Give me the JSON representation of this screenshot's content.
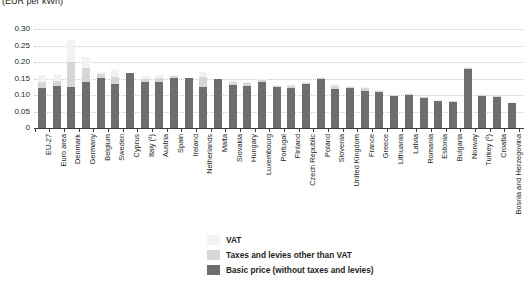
{
  "chart_data": {
    "type": "bar",
    "title": "(EUR per kWh)",
    "subtitle": "",
    "xlabel": "",
    "ylabel": "",
    "ylim": [
      0,
      0.3
    ],
    "yticks": [
      "0",
      "0.05",
      "0.10",
      "0.15",
      "0.20",
      "0.25",
      "0.30"
    ],
    "ytick_values": [
      0,
      0.05,
      0.1,
      0.15,
      0.2,
      0.25,
      0.3
    ],
    "grid": true,
    "stacked": true,
    "legend_position": "bottom-center",
    "categories": [
      "EU-27",
      "Euro area",
      "Denmark",
      "Germany",
      "Belgium",
      "Sweden",
      "Cyprus",
      "Italy (²)",
      "Austria",
      "Spain",
      "Ireland",
      "Netherlands",
      "Malta",
      "Slovakia",
      "Hungary",
      "Luxembourg",
      "Portugal",
      "Finland",
      "Czech Republic",
      "Poland",
      "Slovenia",
      "United Kingdom",
      "France",
      "Greece",
      "Lithuania",
      "Latvia",
      "Romania",
      "Estonia",
      "Bulgaria",
      "Norway",
      "Turkey (²)",
      "Croatia",
      "Bosnia and Herzegovina"
    ],
    "series": [
      {
        "name": "Basic price (without taxes and levies)",
        "color": "#6e6e6e",
        "values": [
          0.122,
          0.126,
          0.125,
          0.138,
          0.153,
          0.134,
          0.166,
          0.14,
          0.139,
          0.152,
          0.152,
          0.124,
          0.15,
          0.131,
          0.127,
          0.138,
          0.124,
          0.121,
          0.134,
          0.149,
          0.117,
          0.12,
          0.113,
          0.109,
          0.097,
          0.101,
          0.091,
          0.081,
          0.079,
          0.178,
          0.098,
          0.094,
          0.075
        ]
      },
      {
        "name": "Taxes and levies other than VAT",
        "color": "#d6d6d6",
        "values": [
          0.017,
          0.016,
          0.075,
          0.045,
          0.01,
          0.02,
          0.0,
          0.01,
          0.012,
          0.005,
          0.0,
          0.031,
          0.0,
          0.008,
          0.008,
          0.008,
          0.004,
          0.005,
          0.002,
          0.002,
          0.01,
          0.004,
          0.008,
          0.004,
          0.002,
          0.002,
          0.002,
          0.002,
          0.002,
          0.003,
          0.002,
          0.002,
          0.002
        ]
      },
      {
        "name": "VAT",
        "color": "#f2f2f2",
        "values": [
          0.021,
          0.022,
          0.068,
          0.032,
          0.008,
          0.024,
          0.0,
          0.008,
          0.01,
          0.004,
          0.0,
          0.015,
          0.0,
          0.007,
          0.006,
          0.004,
          0.003,
          0.006,
          0.004,
          0.004,
          0.007,
          0.002,
          0.004,
          0.003,
          0.002,
          0.002,
          0.002,
          0.002,
          0.002,
          0.004,
          0.002,
          0.002,
          0.002
        ]
      }
    ],
    "totals": [
      0.16,
      0.164,
      0.268,
      0.215,
      0.171,
      0.178,
      0.166,
      0.158,
      0.161,
      0.161,
      0.152,
      0.17,
      0.15,
      0.146,
      0.141,
      0.15,
      0.131,
      0.132,
      0.14,
      0.155,
      0.134,
      0.126,
      0.125,
      0.116,
      0.101,
      0.105,
      0.095,
      0.085,
      0.083,
      0.185,
      0.102,
      0.098,
      0.079
    ]
  },
  "legend": {
    "items": [
      {
        "label": "VAT",
        "swatch": "vat"
      },
      {
        "label": "Taxes and levies other than VAT",
        "swatch": "other"
      },
      {
        "label": "Basic price (without taxes and levies)",
        "swatch": "basic"
      }
    ]
  }
}
